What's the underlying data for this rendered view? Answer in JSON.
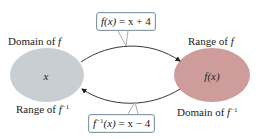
{
  "diagram": {
    "left_set": {
      "top_label": {
        "text": "Domain of ",
        "var": "f",
        "sup": ""
      },
      "bottom_label": {
        "text": "Range of ",
        "var": "f",
        "sup": "−1"
      },
      "element": "x",
      "color": "#c9ced3"
    },
    "right_set": {
      "top_label": {
        "text": "Range of ",
        "var": "f",
        "sup": ""
      },
      "bottom_label": {
        "text": "Domain of ",
        "var": "f",
        "sup": "−1"
      },
      "element": "f(x)",
      "color": "#cf9c9c"
    },
    "forward_function": {
      "lhs": "f(x)",
      "eq": " = x + 4",
      "direction": "left-to-right"
    },
    "inverse_function": {
      "lhs_f": "f",
      "lhs_sup": "−1",
      "lhs_arg": "(x)",
      "eq": " = x − 4",
      "direction": "right-to-left"
    },
    "arrow_color": "#222222",
    "box_border_color": "#8a9aa4"
  }
}
